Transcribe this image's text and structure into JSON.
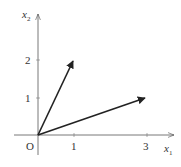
{
  "diagram": {
    "axes": {
      "x_label": "x",
      "x_sub": "1",
      "y_label": "x",
      "y_sub": "2",
      "origin_label": "O"
    },
    "x_ticks": [
      {
        "value": 1,
        "label": "1"
      },
      {
        "value": 3,
        "label": "3"
      }
    ],
    "y_ticks": [
      {
        "value": 1,
        "label": "1"
      },
      {
        "value": 2,
        "label": "2"
      }
    ],
    "vectors": [
      {
        "name": "v1",
        "from": [
          0,
          0
        ],
        "to": [
          1,
          2
        ]
      },
      {
        "name": "v2",
        "from": [
          0,
          0
        ],
        "to": [
          3,
          1
        ]
      }
    ],
    "colors": {
      "axis": "#555555",
      "vector": "#222222"
    }
  }
}
